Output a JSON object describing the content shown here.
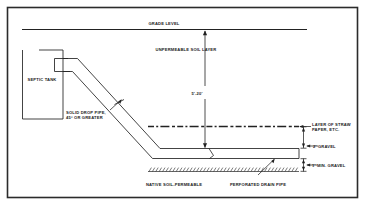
{
  "diagram": {
    "title_present": false,
    "type": "septic-drainfield-cross-section",
    "labels": {
      "grade_level": "GRADE LEVEL",
      "unpermeable_soil_layer": "UNPERMEABLE SOIL LAYER",
      "septic_tank": "SEPTIC TANK",
      "solid_drop_pipe_line1": "SOLID DROP PIPE,",
      "solid_drop_pipe_line2": "45° OR GREATER",
      "depth_dimension": "5'-20'",
      "layer_of_straw_line1": "LAYER OF STRAW",
      "layer_of_straw_line2": "PAPER, ETC.",
      "gravel_two_foot": "2' GRAVEL",
      "gravel_one_foot_min": "1' MIN. GRAVEL",
      "native_soil": "NATIVE SOIL-PERMEABLE",
      "perforated_drain_pipe": "PERFORATED DRAIN PIPE"
    },
    "colors": {
      "ink": "#1a1a1a",
      "line": "#222222",
      "paper": "#ffffff",
      "border": "#2b2b2b"
    }
  }
}
